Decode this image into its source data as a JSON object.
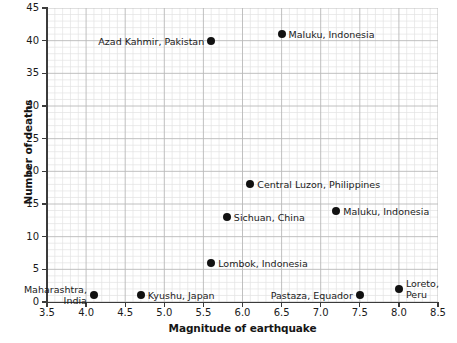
{
  "chart_data": {
    "type": "scatter",
    "title": "",
    "xlabel": "Magnitude of earthquake",
    "ylabel": "Number of deaths",
    "xlim": [
      3.5,
      8.5
    ],
    "ylim": [
      0,
      45
    ],
    "xticks": [
      "3.5",
      "4.0",
      "4.5",
      "5.0",
      "5.5",
      "6.0",
      "6.5",
      "7.0",
      "7.5",
      "8.0",
      "8.5"
    ],
    "xtick_values": [
      3.5,
      4.0,
      4.5,
      5.0,
      5.5,
      6.0,
      6.5,
      7.0,
      7.5,
      8.0,
      8.5
    ],
    "yticks": [
      "0",
      "5",
      "10",
      "15",
      "20",
      "25",
      "30",
      "35",
      "40",
      "45"
    ],
    "ytick_values": [
      0,
      5,
      10,
      15,
      20,
      25,
      30,
      35,
      40,
      45
    ],
    "grid": true,
    "minor_grid": true,
    "minor_grid_divisions": 5,
    "legend": "none",
    "marker_color": "#111111",
    "grid_color": "#b9b9b9",
    "minor_grid_color": "#e2e2e2",
    "axis_color": "#3b3b3b",
    "points": [
      {
        "label": "Maharashtra,\nIndia",
        "x": 4.1,
        "y": 1,
        "label_side": "left",
        "label_lines": [
          "Maharashtra,",
          "India"
        ]
      },
      {
        "label": "Kyushu, Japan",
        "x": 4.7,
        "y": 1,
        "label_side": "right",
        "label_lines": [
          "Kyushu, Japan"
        ]
      },
      {
        "label": "Azad Kahmir, Pakistan",
        "x": 5.6,
        "y": 40,
        "label_side": "left",
        "label_lines": [
          "Azad Kahmir, Pakistan"
        ]
      },
      {
        "label": "Lombok, Indonesia",
        "x": 5.6,
        "y": 6,
        "label_side": "right",
        "label_lines": [
          "Lombok, Indonesia"
        ]
      },
      {
        "label": "Sichuan, China",
        "x": 5.8,
        "y": 13,
        "label_side": "right",
        "label_lines": [
          "Sichuan, China"
        ]
      },
      {
        "label": "Central Luzon, Philippines",
        "x": 6.1,
        "y": 18,
        "label_side": "right",
        "label_lines": [
          "Central Luzon, Philippines"
        ]
      },
      {
        "label": "Maluku, Indonesia",
        "x": 6.5,
        "y": 41,
        "label_side": "right",
        "label_lines": [
          "Maluku, Indonesia"
        ]
      },
      {
        "label": "Maluku, Indonesia",
        "x": 7.2,
        "y": 14,
        "label_side": "right",
        "label_lines": [
          "Maluku, Indonesia"
        ]
      },
      {
        "label": "Pastaza, Equador",
        "x": 7.5,
        "y": 1,
        "label_side": "left",
        "label_lines": [
          "Pastaza, Equador"
        ]
      },
      {
        "label": "Loreto,\nPeru",
        "x": 8.0,
        "y": 2,
        "label_side": "right",
        "label_lines": [
          "Loreto,",
          "Peru"
        ]
      }
    ]
  }
}
